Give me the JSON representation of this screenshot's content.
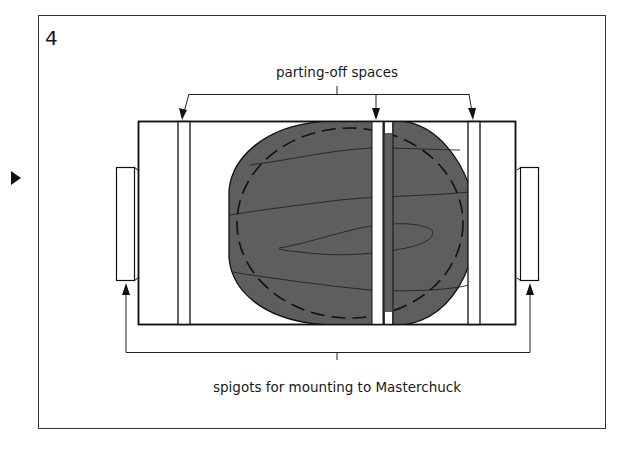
{
  "figure": {
    "number": "4",
    "colors": {
      "line": "#1a1a1a",
      "nut_fill": "#5e5e5e",
      "background": "#ffffff"
    }
  },
  "labels": {
    "top": "parting-off spaces",
    "bottom": "spigots for mounting to Masterchuck"
  },
  "markers": {
    "side_pointer": "triangle-right-icon"
  }
}
